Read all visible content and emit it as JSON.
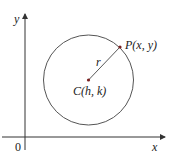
{
  "diagram": {
    "axes": {
      "x_label": "x",
      "y_label": "y",
      "origin_label": "0"
    },
    "circle": {
      "center_label": "C(h, k)",
      "point_label": "P(x, y)",
      "radius_label": "r"
    },
    "colors": {
      "axis": "#333333",
      "circle": "#555555",
      "point": "#7a2020"
    }
  }
}
